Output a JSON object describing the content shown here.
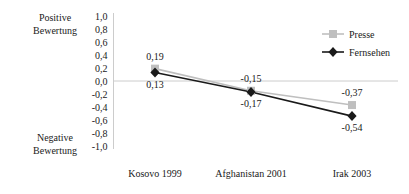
{
  "chart_data": {
    "type": "line",
    "title": "",
    "xlabel": "",
    "ylabel": "",
    "categories": [
      "Kosovo 1999",
      "Afghanistan 2001",
      "Irak 2003"
    ],
    "series": [
      {
        "name": "Presse",
        "values": [
          0.19,
          -0.15,
          -0.37
        ],
        "value_labels": [
          "0,19",
          "-0,15",
          "-0,37"
        ],
        "color": "#bfbfbf",
        "marker": "square"
      },
      {
        "name": "Fernsehen",
        "values": [
          0.13,
          -0.17,
          -0.54
        ],
        "value_labels": [
          "0,13",
          "-0,17",
          "-0,54"
        ],
        "color": "#1a1a1a",
        "marker": "diamond"
      }
    ],
    "ylim": [
      -1.0,
      1.0
    ],
    "ytick_values": [
      1.0,
      0.8,
      0.6,
      0.4,
      0.2,
      0.0,
      -0.2,
      -0.4,
      -0.6,
      -0.8,
      -1.0
    ],
    "ytick_labels": [
      "1,0",
      "0,8",
      "0,6",
      "0,4",
      "0,2",
      "0,0",
      "-0,2",
      "-0,4",
      "-0,6",
      "-0,8",
      "-1,0"
    ],
    "grid": false,
    "zero_line": true,
    "legend_position": "top-right"
  },
  "axis_captions": {
    "top_line1": "Positive",
    "top_line2": "Bewertung",
    "bottom_line1": "Negative",
    "bottom_line2": "Bewertung"
  },
  "legend": {
    "items": [
      {
        "label": "Presse"
      },
      {
        "label": "Fernsehen"
      }
    ]
  },
  "colors": {
    "presse": "#bfbfbf",
    "fernsehen": "#1a1a1a",
    "axis": "#cccccc",
    "text": "#1a1a1a"
  }
}
